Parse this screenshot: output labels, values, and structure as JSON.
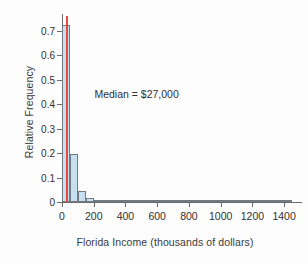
{
  "chart_data": {
    "type": "bar",
    "title": "",
    "xlabel": "Florida Income (thousands of dollars)",
    "ylabel": "Relative Frequency",
    "xlim": [
      0,
      1500
    ],
    "ylim": [
      0,
      0.76
    ],
    "grid": false,
    "legend": null,
    "bin_width": 50,
    "x_ticks": [
      0,
      200,
      400,
      600,
      800,
      1000,
      1200,
      1400
    ],
    "x_tick_labels": [
      "0",
      "200",
      "400",
      "600",
      "800",
      "1000",
      "1200",
      "1400"
    ],
    "y_ticks": [
      0,
      0.1,
      0.2,
      0.3,
      0.4,
      0.5,
      0.6,
      0.7
    ],
    "y_tick_labels": [
      "0",
      "0.1",
      "0.2",
      "0.3",
      "0.4",
      "0.5",
      "0.6",
      "0.7"
    ],
    "bin_starts": [
      0,
      50,
      100,
      150,
      200,
      250,
      300,
      350,
      400,
      450,
      500,
      550,
      600,
      650,
      700,
      750,
      800,
      850,
      900,
      950,
      1000,
      1050,
      1100,
      1150,
      1200,
      1250,
      1300,
      1350,
      1400
    ],
    "values": [
      0.725,
      0.198,
      0.047,
      0.018,
      0.007,
      0.002,
      0.003,
      0.002,
      0.003,
      0.006,
      0.002,
      0.001,
      0.001,
      0.001,
      0.001,
      0.001,
      0.001,
      0.0,
      0.0,
      0.001,
      0.002,
      0.001,
      0.001,
      0.0,
      0.0,
      0.0,
      0.0,
      0.0,
      0.0
    ],
    "annotations": [
      {
        "name": "median-note",
        "text": "Median = $27,000",
        "x": 470,
        "y": 0.44
      }
    ],
    "reference_lines": [
      {
        "name": "median-line",
        "orientation": "vertical",
        "x": 27,
        "color": "#e8493f",
        "y_top": 0.76
      }
    ]
  },
  "colors": {
    "bar_fill": "#c6e0f2",
    "bar_edge": "#737b82",
    "median": "#e8493f",
    "axis": "#6b6b6b",
    "text": "#303030",
    "background": "#fdfdfd"
  }
}
